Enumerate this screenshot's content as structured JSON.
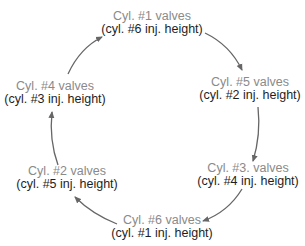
{
  "diagram": {
    "type": "cycle",
    "colors": {
      "valve_text": "#8a8a8a",
      "height_text": "#1e1e1e",
      "arrow": "#666666"
    },
    "nodes": [
      {
        "id": "n1",
        "valves": "Cyl. #1 valves",
        "height": "(cyl. #6 inj. height)"
      },
      {
        "id": "n2",
        "valves": "Cyl. #5 valves",
        "height": "(cyl. #2 inj. height)"
      },
      {
        "id": "n3",
        "valves": "Cyl. #3. valves",
        "height": "(cyl. #4 inj. height)"
      },
      {
        "id": "n4",
        "valves": "Cyl. #6 valves",
        "height": "(cyl. #1 inj. height)"
      },
      {
        "id": "n5",
        "valves": "Cyl. #2 valves",
        "height": "(cyl. #5 inj. height)"
      },
      {
        "id": "n6",
        "valves": "Cyl. #4 valves",
        "height": "(cyl. #3 inj. height)"
      }
    ],
    "edges": [
      {
        "from": "n1",
        "to": "n2"
      },
      {
        "from": "n2",
        "to": "n3"
      },
      {
        "from": "n3",
        "to": "n4"
      },
      {
        "from": "n4",
        "to": "n5"
      },
      {
        "from": "n5",
        "to": "n6"
      },
      {
        "from": "n6",
        "to": "n1"
      }
    ],
    "direction": "clockwise"
  }
}
